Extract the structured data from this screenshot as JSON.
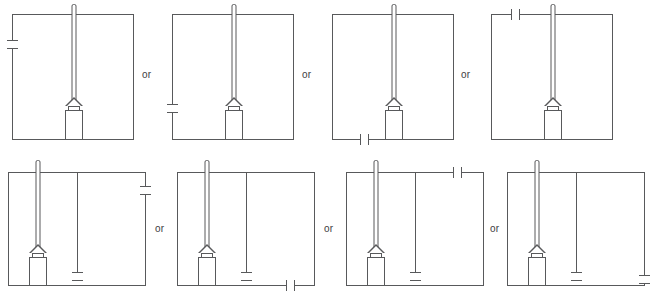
{
  "figure": {
    "type": "technical-line-diagram",
    "rows": 2,
    "columns": 4,
    "line_color": "#58595b",
    "text_color": "#414042",
    "background": "#ffffff"
  },
  "separators": [
    {
      "label": "or"
    },
    {
      "label": "or"
    },
    {
      "label": "or"
    },
    {
      "label": "or"
    },
    {
      "label": "or"
    },
    {
      "label": "or"
    }
  ],
  "panels": [
    {
      "id": "panel-1",
      "row": 1,
      "column": 1,
      "probe_position": "center",
      "has_inner_line": false,
      "break_marker": {
        "edge": "left",
        "orientation": "vertical",
        "position": "upper"
      }
    },
    {
      "id": "panel-2",
      "row": 1,
      "column": 2,
      "probe_position": "center",
      "has_inner_line": false,
      "break_marker": {
        "edge": "left",
        "orientation": "vertical",
        "position": "lower"
      }
    },
    {
      "id": "panel-3",
      "row": 1,
      "column": 3,
      "probe_position": "center",
      "has_inner_line": false,
      "break_marker": {
        "edge": "bottom",
        "orientation": "horizontal",
        "position": "right"
      }
    },
    {
      "id": "panel-4",
      "row": 1,
      "column": 4,
      "probe_position": "center",
      "has_inner_line": false,
      "break_marker": {
        "edge": "top",
        "orientation": "horizontal",
        "position": "left"
      }
    },
    {
      "id": "panel-5",
      "row": 2,
      "column": 1,
      "probe_position": "left",
      "has_inner_line": true,
      "break_marker": {
        "edge": "right",
        "orientation": "vertical",
        "position": "upper"
      }
    },
    {
      "id": "panel-6",
      "row": 2,
      "column": 2,
      "probe_position": "left",
      "has_inner_line": true,
      "break_marker": {
        "edge": "bottom",
        "orientation": "horizontal",
        "position": "right"
      }
    },
    {
      "id": "panel-7",
      "row": 2,
      "column": 3,
      "probe_position": "left",
      "has_inner_line": true,
      "break_marker": {
        "edge": "top",
        "orientation": "horizontal",
        "position": "right"
      }
    },
    {
      "id": "panel-8",
      "row": 2,
      "column": 4,
      "probe_position": "left",
      "has_inner_line": true,
      "break_marker": {
        "edge": "right",
        "orientation": "vertical",
        "position": "lower"
      }
    }
  ]
}
